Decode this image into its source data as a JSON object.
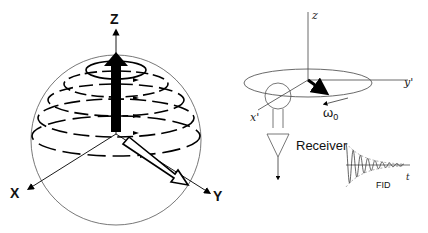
{
  "left_panel": {
    "axis_labels": {
      "z": "Z",
      "x": "X",
      "y": "Y"
    }
  },
  "right_panel": {
    "axis_labels": {
      "z": "z",
      "x": "x'",
      "y": "y'"
    },
    "omega_label": "ω",
    "omega_subscript": "0",
    "receiver_label": "Receiver",
    "fid_label": "FID",
    "time_label": "t"
  }
}
